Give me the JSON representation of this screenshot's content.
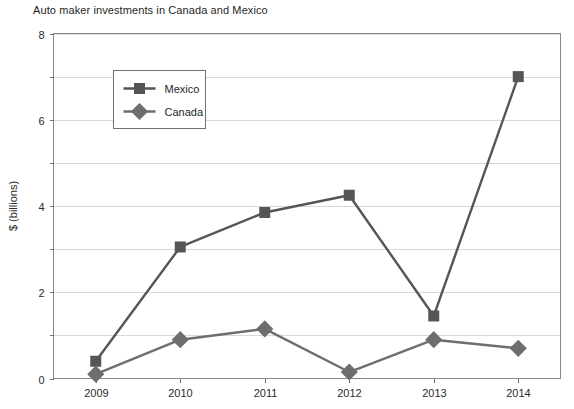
{
  "chart_data": {
    "type": "line",
    "title": "Auto maker investments in Canada and Mexico",
    "xlabel": "",
    "ylabel": "$ (billions)",
    "categories": [
      "2009",
      "2010",
      "2011",
      "2012",
      "2013",
      "2014"
    ],
    "x": [
      2009,
      2010,
      2011,
      2012,
      2013,
      2014
    ],
    "ylim": [
      0,
      8
    ],
    "ytick_major": [
      0,
      2,
      4,
      6,
      8
    ],
    "ytick_minor": [
      1,
      3,
      5,
      7
    ],
    "grid": true,
    "legend_position": "upper-left-inside",
    "series": [
      {
        "name": "Mexico",
        "marker": "square",
        "color": "#555555",
        "values": [
          0.4,
          3.05,
          3.85,
          4.25,
          1.45,
          7.0
        ]
      },
      {
        "name": "Canada",
        "marker": "diamond",
        "color": "#6e6e6e",
        "values": [
          0.1,
          0.9,
          1.15,
          0.15,
          0.9,
          0.7
        ]
      }
    ]
  },
  "colors": {
    "mexico": "#555555",
    "canada": "#6e6e6e",
    "gridline": "#d8d8d8",
    "frame": "#8a8a8a",
    "text": "#1f1f1f",
    "background": "#ffffff"
  }
}
